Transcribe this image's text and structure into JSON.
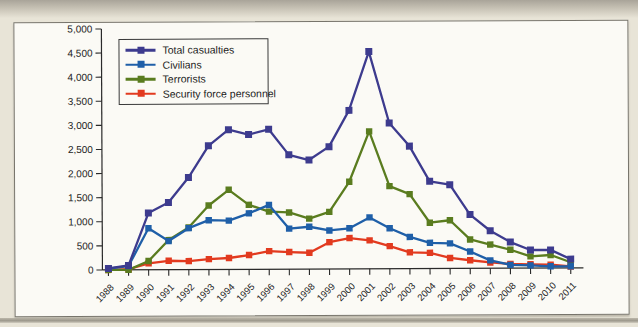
{
  "page": {
    "background_color": "#e8e4d7",
    "figure_background": "#fbfaf5",
    "figure_border_color": "#77746b",
    "axis_color": "#2a2a2a",
    "text_color": "#1c1c1c"
  },
  "y_axis": {
    "tick_labels": [
      "5,000",
      "4,500",
      "4,000",
      "3,500",
      "3,000",
      "2,500",
      "2,000",
      "1,500",
      "1,000",
      "500",
      "0"
    ]
  },
  "x_axis": {
    "tick_labels": [
      "1988",
      "1989",
      "1990",
      "1991",
      "1992",
      "1993",
      "1994",
      "1995",
      "1996",
      "1997",
      "1998",
      "1999",
      "2000",
      "2001",
      "2002",
      "2003",
      "2004",
      "2005",
      "2006",
      "2007",
      "2008",
      "2009",
      "2010",
      "2011"
    ]
  },
  "chart_data": {
    "type": "line",
    "title": "",
    "xlabel": "",
    "ylabel": "",
    "grid": false,
    "legend_position": "top-left",
    "ylim": [
      0,
      5000
    ],
    "ytick_step": 500,
    "x": [
      1988,
      1989,
      1990,
      1991,
      1992,
      1993,
      1994,
      1995,
      1996,
      1997,
      1998,
      1999,
      2000,
      2001,
      2002,
      2003,
      2004,
      2005,
      2006,
      2007,
      2008,
      2009,
      2010,
      2011
    ],
    "series": [
      {
        "name": "Total casualties",
        "color": "#3d3b8e",
        "values": [
          31,
          92,
          1177,
          1393,
          1909,
          2567,
          2899,
          2796,
          2903,
          2372,
          2261,
          2538,
          3288,
          4507,
          3022,
          2542,
          1810,
          1739,
          1116,
          777,
          541,
          375,
          375,
          183
        ]
      },
      {
        "name": "Civilians",
        "color": "#1f5fa8",
        "values": [
          29,
          79,
          862,
          594,
          859,
          1023,
          1012,
          1161,
          1333,
          840,
          877,
          799,
          842,
          1067,
          839,
          658,
          534,
          521,
          349,
          164,
          69,
          55,
          36,
          34
        ]
      },
      {
        "name": "Terrorists",
        "color": "#5a7c1f",
        "values": [
          1,
          0,
          183,
          614,
          873,
          1328,
          1651,
          1338,
          1194,
          1177,
          1045,
          1184,
          1808,
          2850,
          1714,
          1546,
          951,
          1000,
          599,
          492,
          382,
          242,
          270,
          119
        ]
      },
      {
        "name": "Security force personnel",
        "color": "#e23a1f",
        "values": [
          1,
          13,
          132,
          185,
          177,
          216,
          236,
          297,
          376,
          355,
          339,
          555,
          638,
          590,
          469,
          338,
          325,
          218,
          168,
          121,
          90,
          78,
          69,
          30
        ]
      }
    ]
  }
}
